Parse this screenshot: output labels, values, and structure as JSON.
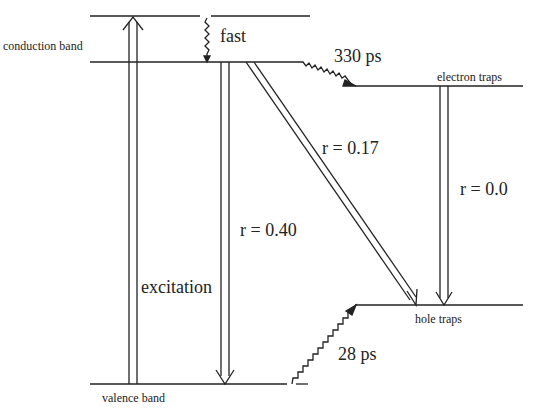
{
  "diagram": {
    "type": "energy-level-diagram",
    "levels": {
      "upper": "",
      "conduction_band": "conduction band",
      "valence_band": "valence band",
      "electron_traps": "electron traps",
      "hole_traps": "hole traps"
    },
    "transitions": {
      "excitation": "excitation",
      "fast": "fast",
      "electron_trapping": "330 ps",
      "hole_trapping": "28 ps",
      "band_to_band": "r = 0.40",
      "cb_to_hole_traps": "r = 0.17",
      "trap_to_trap": "r = 0.0"
    },
    "colors": {
      "line": "#222222",
      "background": "#ffffff"
    }
  }
}
